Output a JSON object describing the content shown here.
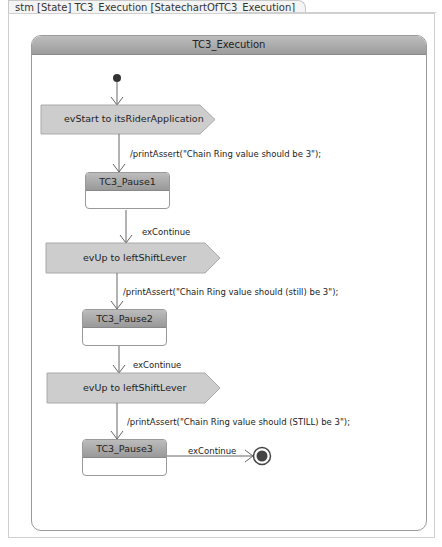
{
  "diagram": {
    "tab_title": "stm [State] TC3_Execution [StatechartOfTC3_Execution]",
    "composite_state": {
      "name": "TC3_Execution"
    },
    "signals": [
      {
        "label": "evStart to itsRiderApplication"
      },
      {
        "label": "evUp to leftShiftLever"
      },
      {
        "label": "evUp to leftShiftLever"
      }
    ],
    "states": [
      {
        "name": "TC3_Pause1"
      },
      {
        "name": "TC3_Pause2"
      },
      {
        "name": "TC3_Pause3"
      }
    ],
    "transitions": {
      "actions": [
        "/printAssert(\"Chain Ring value should be 3\");",
        "/printAssert(\"Chain Ring value should (still)  be 3\");",
        "/printAssert(\"Chain Ring value should (STILL) be 3\");"
      ],
      "triggers": [
        "exContinue",
        "exContinue",
        "exContinue"
      ]
    },
    "colors": {
      "header_fill": "#a8a8a8",
      "signal_fill": "#cdcdcd",
      "border": "#999999",
      "final_state": "#444444"
    }
  }
}
